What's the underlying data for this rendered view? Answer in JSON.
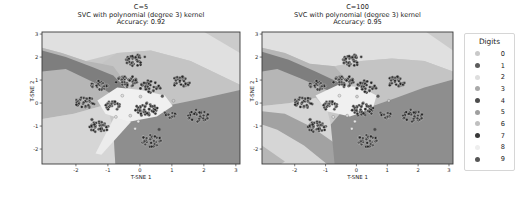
{
  "figure": {
    "bg": "#ffffff"
  },
  "chart_data": {
    "type": "scatter",
    "plots": [
      {
        "id": "svc-c5",
        "title_lines": [
          "C=5",
          "SVC with polynomial (degree 3) kernel",
          "Accuracy: 0.92"
        ],
        "xlabel": "T-SNE 1",
        "ylabel": "T-SNE 2",
        "xlim": [
          -3.06,
          3.13
        ],
        "ylim": [
          -2.65,
          3.09
        ],
        "xticks": [
          -2,
          -1,
          0,
          1,
          2,
          3
        ],
        "yticks": [
          3,
          2,
          1,
          0,
          -1,
          -2
        ],
        "grid": false,
        "regions": [
          {
            "name": "base",
            "color": "#c8c8c8",
            "poly": [
              [
                0,
                0
              ],
              [
                100,
                0
              ],
              [
                100,
                100
              ],
              [
                0,
                100
              ]
            ]
          },
          {
            "name": "top-light",
            "color": "#e0e0e0",
            "poly": [
              [
                0,
                0
              ],
              [
                100,
                0
              ],
              [
                100,
                40
              ],
              [
                75,
                22
              ],
              [
                55,
                14
              ],
              [
                38,
                16
              ],
              [
                22,
                22
              ],
              [
                10,
                16
              ],
              [
                0,
                12
              ]
            ]
          },
          {
            "name": "top-right-corner",
            "color": "#cbcbcb",
            "poly": [
              [
                82,
                0
              ],
              [
                100,
                0
              ],
              [
                100,
                16
              ]
            ]
          },
          {
            "name": "mid-band",
            "color": "#c4c4c4",
            "poly": [
              [
                38,
                16
              ],
              [
                55,
                14
              ],
              [
                75,
                22
              ],
              [
                100,
                40
              ],
              [
                100,
                44
              ],
              [
                82,
                50
              ],
              [
                66,
                55
              ],
              [
                56,
                60
              ],
              [
                50,
                50
              ],
              [
                42,
                38
              ],
              [
                36,
                26
              ],
              [
                30,
                24
              ]
            ]
          },
          {
            "name": "left-medium",
            "color": "#b6b6b6",
            "poly": [
              [
                0,
                12
              ],
              [
                10,
                16
              ],
              [
                22,
                22
              ],
              [
                30,
                24
              ],
              [
                36,
                26
              ],
              [
                42,
                38
              ],
              [
                40,
                48
              ],
              [
                30,
                56
              ],
              [
                16,
                62
              ],
              [
                0,
                66
              ]
            ]
          },
          {
            "name": "dark-diagonal-band",
            "color": "#7e7e7e",
            "poly": [
              [
                0,
                14
              ],
              [
                12,
                19
              ],
              [
                26,
                27
              ],
              [
                36,
                33
              ],
              [
                44,
                45
              ],
              [
                50,
                52
              ],
              [
                44,
                56
              ],
              [
                36,
                48
              ],
              [
                26,
                38
              ],
              [
                12,
                28
              ],
              [
                0,
                30
              ]
            ]
          },
          {
            "name": "bottom-left-light",
            "color": "#d6d6d6",
            "poly": [
              [
                0,
                66
              ],
              [
                16,
                62
              ],
              [
                30,
                56
              ],
              [
                34,
                62
              ],
              [
                36,
                74
              ],
              [
                37,
                100
              ],
              [
                0,
                100
              ]
            ]
          },
          {
            "name": "bottom-right-dark",
            "color": "#8e8e8e",
            "poly": [
              [
                37,
                100
              ],
              [
                36,
                74
              ],
              [
                40,
                64
              ],
              [
                50,
                58
              ],
              [
                56,
                60
              ],
              [
                66,
                55
              ],
              [
                82,
                50
              ],
              [
                100,
                44
              ],
              [
                100,
                100
              ]
            ]
          },
          {
            "name": "pale-spike",
            "color": "#ececec",
            "poly": [
              [
                27,
                92
              ],
              [
                37,
                63
              ],
              [
                45,
                68
              ],
              [
                30,
                93
              ]
            ]
          },
          {
            "name": "center-pale",
            "color": "#f0f0f0",
            "poly": [
              [
                28,
                52
              ],
              [
                38,
                42
              ],
              [
                50,
                44
              ],
              [
                62,
                48
              ],
              [
                66,
                56
              ],
              [
                58,
                64
              ],
              [
                44,
                68
              ],
              [
                32,
                62
              ]
            ]
          }
        ]
      },
      {
        "id": "svc-c100",
        "title_lines": [
          "C=100",
          "SVC with polynomial (degree 3) kernel",
          "Accuracy: 0.95"
        ],
        "xlabel": "T-SNE 1",
        "ylabel": "T-SNE 2",
        "xlim": [
          -3.06,
          3.13
        ],
        "ylim": [
          -2.65,
          3.09
        ],
        "xticks": [
          -2,
          -1,
          0,
          1,
          2,
          3
        ],
        "yticks": [
          3,
          2,
          1,
          0,
          -1,
          -2
        ],
        "grid": false,
        "regions": [
          {
            "name": "base",
            "color": "#c8c8c8",
            "poly": [
              [
                0,
                0
              ],
              [
                100,
                0
              ],
              [
                100,
                100
              ],
              [
                0,
                100
              ]
            ]
          },
          {
            "name": "top-light",
            "color": "#e0e0e0",
            "poly": [
              [
                0,
                0
              ],
              [
                100,
                0
              ],
              [
                100,
                30
              ],
              [
                85,
                22
              ],
              [
                68,
                20
              ],
              [
                52,
                22
              ],
              [
                38,
                26
              ],
              [
                25,
                24
              ],
              [
                12,
                16
              ],
              [
                0,
                12
              ]
            ]
          },
          {
            "name": "top-right-corner",
            "color": "#cbcbcb",
            "poly": [
              [
                86,
                0
              ],
              [
                100,
                0
              ],
              [
                100,
                14
              ]
            ]
          },
          {
            "name": "mid-band",
            "color": "#c4c4c4",
            "poly": [
              [
                38,
                26
              ],
              [
                52,
                22
              ],
              [
                68,
                20
              ],
              [
                85,
                22
              ],
              [
                100,
                30
              ],
              [
                100,
                36
              ],
              [
                85,
                42
              ],
              [
                70,
                50
              ],
              [
                58,
                56
              ],
              [
                50,
                46
              ],
              [
                44,
                36
              ]
            ]
          },
          {
            "name": "left-medium",
            "color": "#b6b6b6",
            "poly": [
              [
                0,
                12
              ],
              [
                12,
                16
              ],
              [
                25,
                24
              ],
              [
                38,
                26
              ],
              [
                44,
                36
              ],
              [
                40,
                44
              ],
              [
                28,
                50
              ],
              [
                14,
                54
              ],
              [
                0,
                56
              ]
            ]
          },
          {
            "name": "dark-diagonal-band",
            "color": "#7e7e7e",
            "poly": [
              [
                0,
                15
              ],
              [
                14,
                21
              ],
              [
                28,
                30
              ],
              [
                40,
                38
              ],
              [
                50,
                46
              ],
              [
                44,
                52
              ],
              [
                34,
                44
              ],
              [
                20,
                35
              ],
              [
                8,
                28
              ],
              [
                0,
                30
              ]
            ]
          },
          {
            "name": "bottom-left-light",
            "color": "#d6d6d6",
            "poly": [
              [
                0,
                56
              ],
              [
                14,
                54
              ],
              [
                28,
                50
              ],
              [
                34,
                58
              ],
              [
                36,
                70
              ],
              [
                38,
                100
              ],
              [
                0,
                100
              ]
            ]
          },
          {
            "name": "gray-lower-band",
            "color": "#a2a2a2",
            "poly": [
              [
                0,
                60
              ],
              [
                12,
                62
              ],
              [
                26,
                72
              ],
              [
                38,
                84
              ],
              [
                46,
                98
              ],
              [
                44,
                100
              ],
              [
                34,
                100
              ],
              [
                22,
                86
              ],
              [
                8,
                74
              ],
              [
                0,
                70
              ]
            ]
          },
          {
            "name": "bottom-left-corner",
            "color": "#b6b6b6",
            "poly": [
              [
                0,
                86
              ],
              [
                12,
                98
              ],
              [
                10,
                100
              ],
              [
                0,
                100
              ]
            ]
          },
          {
            "name": "bottom-right-dark",
            "color": "#8e8e8e",
            "poly": [
              [
                38,
                100
              ],
              [
                36,
                70
              ],
              [
                42,
                60
              ],
              [
                52,
                56
              ],
              [
                58,
                56
              ],
              [
                70,
                50
              ],
              [
                85,
                42
              ],
              [
                100,
                36
              ],
              [
                100,
                100
              ]
            ]
          },
          {
            "name": "center-pale",
            "color": "#f0f0f0",
            "poly": [
              [
                28,
                48
              ],
              [
                40,
                40
              ],
              [
                52,
                42
              ],
              [
                60,
                48
              ],
              [
                58,
                58
              ],
              [
                46,
                64
              ],
              [
                34,
                60
              ]
            ]
          }
        ]
      }
    ],
    "clusters": [
      {
        "digit": 4,
        "x": -0.1,
        "y": 1.85,
        "r": 0.3,
        "n": 42,
        "color": "#3c3c3c"
      },
      {
        "digit": 1,
        "x": -0.42,
        "y": 0.95,
        "r": 0.3,
        "n": 40,
        "color": "#454545"
      },
      {
        "digit": 7,
        "x": 0.32,
        "y": 0.72,
        "r": 0.3,
        "n": 40,
        "color": "#383838"
      },
      {
        "digit": 9,
        "x": 1.28,
        "y": 0.92,
        "r": 0.27,
        "n": 34,
        "color": "#424242"
      },
      {
        "digit": 3,
        "x": -1.25,
        "y": 0.78,
        "r": 0.24,
        "n": 28,
        "color": "#494949"
      },
      {
        "digit": 5,
        "x": -1.72,
        "y": 0.02,
        "r": 0.28,
        "n": 36,
        "color": "#404040"
      },
      {
        "digit": 8,
        "x": -0.85,
        "y": -0.12,
        "r": 0.22,
        "n": 22,
        "color": "#4e4e4e"
      },
      {
        "digit": 0,
        "x": 0.18,
        "y": -0.28,
        "r": 0.34,
        "n": 48,
        "color": "#3a3a3a"
      },
      {
        "digit": 2,
        "x": 0.95,
        "y": -0.5,
        "r": 0.18,
        "n": 16,
        "color": "#474747"
      },
      {
        "digit": 6,
        "x": 1.82,
        "y": -0.55,
        "r": 0.3,
        "n": 38,
        "color": "#3e3e3e"
      },
      {
        "digit": 9,
        "x": -1.3,
        "y": -1.05,
        "r": 0.28,
        "n": 36,
        "color": "#424242"
      },
      {
        "digit": 1,
        "x": 0.35,
        "y": -1.65,
        "r": 0.3,
        "n": 40,
        "color": "#454545"
      }
    ],
    "outliers": [
      {
        "x": -0.55,
        "y": 0.32,
        "color": "#e2e2e2"
      },
      {
        "x": -0.3,
        "y": -0.55,
        "color": "#dadada"
      },
      {
        "x": -0.05,
        "y": -0.8,
        "color": "#e6e6e6"
      },
      {
        "x": 0.02,
        "y": 0.28,
        "color": "#d2d2d2"
      },
      {
        "x": -0.75,
        "y": -0.6,
        "color": "#e0e0e0"
      },
      {
        "x": 0.6,
        "y": -1.15,
        "color": "#4a4a4a"
      },
      {
        "x": -1.5,
        "y": -0.72,
        "color": "#444444"
      },
      {
        "x": 0.7,
        "y": 0.3,
        "color": "#555555"
      },
      {
        "x": -0.15,
        "y": -1.12,
        "color": "#e4e4e4"
      },
      {
        "x": 1.05,
        "y": 0.1,
        "color": "#cfcfcf"
      }
    ],
    "point_style": {
      "radius": 1.45,
      "stroke": "#d9d9d9",
      "stroke_width": 0.35
    },
    "axis_style": {
      "spine_color": "#3a3a3a",
      "tick_color": "#262626",
      "tick_font_px": 5.2
    },
    "legend": {
      "title": "Digits",
      "position": "right",
      "entries": [
        {
          "label": "0",
          "color": "#c9c9c9"
        },
        {
          "label": "1",
          "color": "#5c5c5c"
        },
        {
          "label": "2",
          "color": "#dedede"
        },
        {
          "label": "3",
          "color": "#a9a9a9"
        },
        {
          "label": "4",
          "color": "#4d4d4d"
        },
        {
          "label": "5",
          "color": "#9f9f9f"
        },
        {
          "label": "6",
          "color": "#c0c0c0"
        },
        {
          "label": "7",
          "color": "#383838"
        },
        {
          "label": "8",
          "color": "#eeeeee"
        },
        {
          "label": "9",
          "color": "#565656"
        }
      ]
    }
  }
}
